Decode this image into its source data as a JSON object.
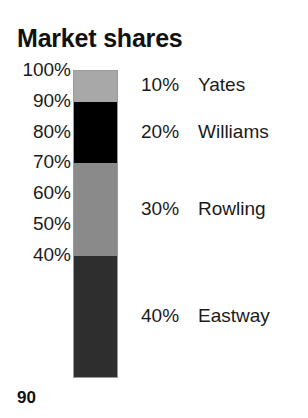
{
  "title": "Market shares",
  "page_number": "90",
  "axis": {
    "tick_labels": [
      "100%",
      "90%",
      "80%",
      "70%",
      "60%",
      "50%",
      "40%"
    ],
    "tick_values": [
      100,
      90,
      80,
      70,
      60,
      50,
      40
    ]
  },
  "legend": [
    {
      "value": "10%",
      "name": "Yates"
    },
    {
      "value": "20%",
      "name": "Williams"
    },
    {
      "value": "30%",
      "name": "Rowling"
    },
    {
      "value": "40%",
      "name": "Eastway"
    }
  ],
  "chart_data": {
    "type": "bar",
    "title": "Market shares",
    "subtitle": "",
    "xlabel": "",
    "ylabel": "",
    "orientation": "vertical-stacked",
    "stacked": true,
    "categories": [
      "Market shares"
    ],
    "ylim": [
      0,
      100
    ],
    "ytick_labels": [
      "100%",
      "90%",
      "80%",
      "70%",
      "60%",
      "50%",
      "40%"
    ],
    "yticks": [
      100,
      90,
      80,
      70,
      60,
      50,
      40
    ],
    "grid": false,
    "legend_position": "right",
    "series": [
      {
        "name": "Yates",
        "values": [
          10
        ],
        "value_label": "10%",
        "color": "#a8a8a8",
        "range": [
          90,
          100
        ]
      },
      {
        "name": "Williams",
        "values": [
          20
        ],
        "value_label": "20%",
        "color": "#000000",
        "range": [
          70,
          90
        ]
      },
      {
        "name": "Rowling",
        "values": [
          30
        ],
        "value_label": "30%",
        "color": "#8a8a8a",
        "range": [
          40,
          70
        ]
      },
      {
        "name": "Eastway",
        "values": [
          40
        ],
        "value_label": "40%",
        "color": "#2e2e2e",
        "range": [
          0,
          40
        ]
      }
    ],
    "annotations": [
      "90"
    ]
  },
  "colors": {
    "background": "#ffffff",
    "text": "#1b1b1b",
    "title": "#111111",
    "bar_border": "#9a9a9a"
  }
}
